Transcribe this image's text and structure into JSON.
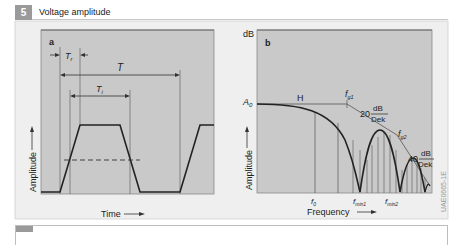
{
  "header": {
    "number": "5",
    "title": "Voltage amplitude"
  },
  "panel_a": {
    "label": "a",
    "tr_label": "T",
    "tr_sub": "r",
    "t_label": "T",
    "ti_label": "T",
    "ti_sub": "i",
    "xlabel": "Time",
    "ylabel": "Amplitude"
  },
  "panel_b": {
    "label": "b",
    "y_unit": "dB",
    "a0_label": "A",
    "a0_sub": "0",
    "h_label": "H",
    "fg1_label": "f",
    "fg1_sub": "g1",
    "fg2_label": "f",
    "fg2_sub": "g2",
    "slope1_value": "20",
    "slope1_num": "dB",
    "slope1_den": "Dek",
    "slope2_value": "40",
    "slope2_num": "dB",
    "slope2_den": "Dek",
    "f0_label": "f",
    "f0_sub": "0",
    "fmin1_label": "f",
    "fmin1_sub": "min1",
    "fmin2_label": "f",
    "fmin2_sub": "min2",
    "xlabel": "Frequency",
    "ylabel": "Amplitude"
  },
  "figure_code": "UAE0665-1E",
  "colors": {
    "plot_bg": "#c9c9c9",
    "frame_bg": "#efefef",
    "badge": "#9a9a9a",
    "curve": "#2a2a2a"
  }
}
